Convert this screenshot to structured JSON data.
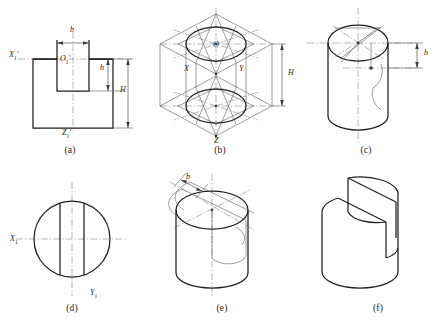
{
  "figure": {
    "background_color": "#ffffff",
    "line_color": "#1d1d1d",
    "construction_color": "#7d7d7d"
  },
  "panels": [
    {
      "id": "a",
      "caption": "(a)",
      "description": "front view of slotted block with axes and dimensions",
      "labels": [
        {
          "name": "axis-x1-prime",
          "text": "X",
          "sub": "1",
          "prime": "'",
          "x": 9,
          "y": 56
        },
        {
          "name": "origin-o1-prime",
          "text": "O",
          "sub": "1",
          "prime": "'",
          "x": 60,
          "y": 60
        },
        {
          "name": "axis-z1-prime",
          "text": "Z",
          "sub": "1",
          "prime": "'",
          "x": 62,
          "y": 133
        },
        {
          "name": "dimension-b",
          "text": "b",
          "sub": "",
          "prime": "",
          "x": 71,
          "y": 30
        },
        {
          "name": "dimension-h",
          "text": "h",
          "sub": "",
          "prime": "",
          "x": 104,
          "y": 62
        },
        {
          "name": "dimension-H",
          "text": "H",
          "sub": "",
          "prime": "",
          "x": 121,
          "y": 80
        }
      ]
    },
    {
      "id": "b",
      "caption": "(b)",
      "description": "isometric axonometric layout of top and bottom rhombi with inscribed ellipses",
      "labels": [
        {
          "name": "axis-o",
          "text": "O",
          "sub": "",
          "prime": "",
          "x": 213,
          "y": 46
        },
        {
          "name": "axis-x",
          "text": "X",
          "sub": "",
          "prime": "",
          "x": 184,
          "y": 70
        },
        {
          "name": "axis-y",
          "text": "Y",
          "sub": "",
          "prime": "",
          "x": 239,
          "y": 70
        },
        {
          "name": "axis-z",
          "text": "Z",
          "sub": "",
          "prime": "",
          "x": 214,
          "y": 142
        },
        {
          "name": "dimension-H",
          "text": "H",
          "sub": "",
          "prime": "",
          "x": 268,
          "y": 78
        }
      ]
    },
    {
      "id": "c",
      "caption": "(c)",
      "description": "cylinder body with isometric top ellipse and slot depth construction",
      "labels": [
        {
          "name": "dimension-h",
          "text": "h",
          "sub": "",
          "prime": "",
          "x": 412,
          "y": 60
        }
      ]
    },
    {
      "id": "d",
      "caption": "(d)",
      "description": "top view circle with two slot edge lines",
      "labels": [
        {
          "name": "axis-x1",
          "text": "X",
          "sub": "1",
          "prime": "",
          "x": 11,
          "y": 239
        },
        {
          "name": "axis-y1",
          "text": "Y",
          "sub": "1",
          "prime": "",
          "x": 91,
          "y": 294
        }
      ]
    },
    {
      "id": "e",
      "caption": "(e)",
      "description": "cylinder with slot width b laid out on the top ellipse",
      "labels": [
        {
          "name": "dimension-b",
          "text": "b",
          "sub": "",
          "prime": "",
          "x": 188,
          "y": 180
        }
      ]
    },
    {
      "id": "f",
      "caption": "(f)",
      "description": "finished cylinder with the rectangular slot cut out",
      "labels": []
    }
  ],
  "captions": {
    "a": {
      "text": "(a)",
      "x": 50,
      "y": 148
    },
    "b": {
      "text": "(b)",
      "x": 200,
      "y": 148
    },
    "c": {
      "text": "(c)",
      "x": 348,
      "y": 148
    },
    "d": {
      "text": "(d)",
      "x": 68,
      "y": 306
    },
    "e": {
      "text": "(e)",
      "x": 218,
      "y": 306
    },
    "f": {
      "text": "(f)",
      "x": 362,
      "y": 306
    }
  }
}
